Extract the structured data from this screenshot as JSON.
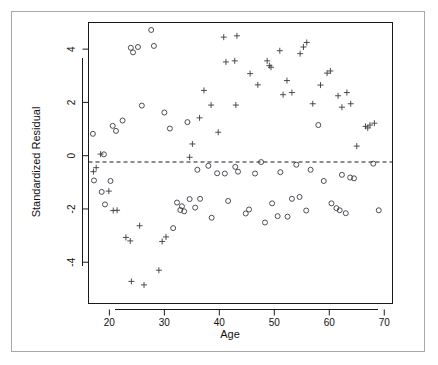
{
  "chart_data": {
    "type": "scatter",
    "title": "",
    "xlabel": "Age",
    "ylabel": "Standardized Residual",
    "xlim": [
      16.2,
      71.5
    ],
    "ylim": [
      -5.55,
      5.0
    ],
    "xticks": [
      20,
      30,
      40,
      50,
      60,
      70
    ],
    "yticks": [
      -4,
      -2,
      0,
      2,
      4
    ],
    "xtick_labels": [
      "20",
      "30",
      "40",
      "50",
      "60",
      "70"
    ],
    "ytick_labels": [
      "-4",
      "-2",
      "0",
      "2",
      "4"
    ],
    "grid": false,
    "legend": null,
    "annotations": [
      {
        "type": "reference-line",
        "orientation": "horizontal",
        "y": 0,
        "style": "dashed"
      }
    ],
    "series": [
      {
        "name": "circle-group",
        "marker": "circle",
        "points": [
          [
            17.0,
            0.82
          ],
          [
            17.2,
            -0.93
          ],
          [
            18.6,
            -1.36
          ],
          [
            19.0,
            0.05
          ],
          [
            19.2,
            -1.83
          ],
          [
            20.2,
            -0.95
          ],
          [
            20.6,
            1.12
          ],
          [
            21.2,
            0.93
          ],
          [
            22.4,
            1.32
          ],
          [
            23.9,
            4.05
          ],
          [
            24.3,
            3.88
          ],
          [
            25.2,
            4.08
          ],
          [
            25.9,
            1.88
          ],
          [
            27.6,
            4.72
          ],
          [
            28.1,
            4.12
          ],
          [
            30.0,
            1.62
          ],
          [
            31.0,
            1.02
          ],
          [
            31.6,
            -2.72
          ],
          [
            32.3,
            -1.76
          ],
          [
            32.9,
            -2.04
          ],
          [
            33.2,
            -1.9
          ],
          [
            33.6,
            -2.09
          ],
          [
            34.2,
            1.26
          ],
          [
            34.6,
            -1.63
          ],
          [
            35.6,
            -1.95
          ],
          [
            36.0,
            -0.53
          ],
          [
            36.5,
            -1.62
          ],
          [
            38.0,
            -0.38
          ],
          [
            38.6,
            -2.33
          ],
          [
            39.6,
            -0.66
          ],
          [
            41.0,
            -0.67
          ],
          [
            41.6,
            -1.7
          ],
          [
            42.9,
            -0.42
          ],
          [
            43.4,
            -0.6
          ],
          [
            44.8,
            -2.17
          ],
          [
            45.4,
            -2.02
          ],
          [
            46.5,
            -0.67
          ],
          [
            47.6,
            -0.24
          ],
          [
            48.3,
            -2.51
          ],
          [
            49.6,
            -1.79
          ],
          [
            50.6,
            -2.27
          ],
          [
            51.1,
            -0.62
          ],
          [
            52.4,
            -2.29
          ],
          [
            53.2,
            -1.62
          ],
          [
            54.0,
            -0.34
          ],
          [
            54.6,
            -1.55
          ],
          [
            55.8,
            -2.06
          ],
          [
            56.6,
            -0.53
          ],
          [
            58.0,
            1.15
          ],
          [
            59.0,
            -0.95
          ],
          [
            60.4,
            -1.79
          ],
          [
            61.3,
            -1.97
          ],
          [
            61.9,
            -2.05
          ],
          [
            62.3,
            -0.72
          ],
          [
            63.0,
            -2.16
          ],
          [
            63.8,
            -0.82
          ],
          [
            64.5,
            -0.85
          ],
          [
            68.0,
            -0.3
          ],
          [
            69.0,
            -2.05
          ]
        ]
      },
      {
        "name": "plus-group",
        "marker": "plus",
        "points": [
          [
            17.1,
            -0.6
          ],
          [
            17.6,
            -0.45
          ],
          [
            18.4,
            0.06
          ],
          [
            19.9,
            -1.33
          ],
          [
            20.7,
            -2.06
          ],
          [
            21.4,
            -2.05
          ],
          [
            23.0,
            -3.07
          ],
          [
            23.8,
            -3.2
          ],
          [
            24.0,
            -4.72
          ],
          [
            25.5,
            -2.63
          ],
          [
            26.3,
            -4.85
          ],
          [
            29.0,
            -4.3
          ],
          [
            29.6,
            -3.22
          ],
          [
            30.3,
            -3.05
          ],
          [
            34.6,
            -0.06
          ],
          [
            35.1,
            0.44
          ],
          [
            36.4,
            1.42
          ],
          [
            37.2,
            2.45
          ],
          [
            38.5,
            1.9
          ],
          [
            39.8,
            0.88
          ],
          [
            40.8,
            4.45
          ],
          [
            41.2,
            3.52
          ],
          [
            42.8,
            3.56
          ],
          [
            43.0,
            1.9
          ],
          [
            43.2,
            4.5
          ],
          [
            45.6,
            3.08
          ],
          [
            47.0,
            2.66
          ],
          [
            48.7,
            3.56
          ],
          [
            49.1,
            3.38
          ],
          [
            49.4,
            3.32
          ],
          [
            51.0,
            3.94
          ],
          [
            51.6,
            2.29
          ],
          [
            52.3,
            2.82
          ],
          [
            53.2,
            2.37
          ],
          [
            54.7,
            3.83
          ],
          [
            55.3,
            4.08
          ],
          [
            55.9,
            4.25
          ],
          [
            57.0,
            1.95
          ],
          [
            58.4,
            2.65
          ],
          [
            59.6,
            3.1
          ],
          [
            60.2,
            3.18
          ],
          [
            61.6,
            2.25
          ],
          [
            62.3,
            1.82
          ],
          [
            63.2,
            2.37
          ],
          [
            63.9,
            1.95
          ],
          [
            65.0,
            0.36
          ],
          [
            66.6,
            1.1
          ],
          [
            67.0,
            1.04
          ],
          [
            67.4,
            1.15
          ],
          [
            68.2,
            1.22
          ]
        ]
      }
    ]
  },
  "figure": {
    "background_color": "#ffffff",
    "frame_color": "#a8a8a8",
    "marker_color": "#3a3a44",
    "axis_color": "#1a1a1a"
  }
}
